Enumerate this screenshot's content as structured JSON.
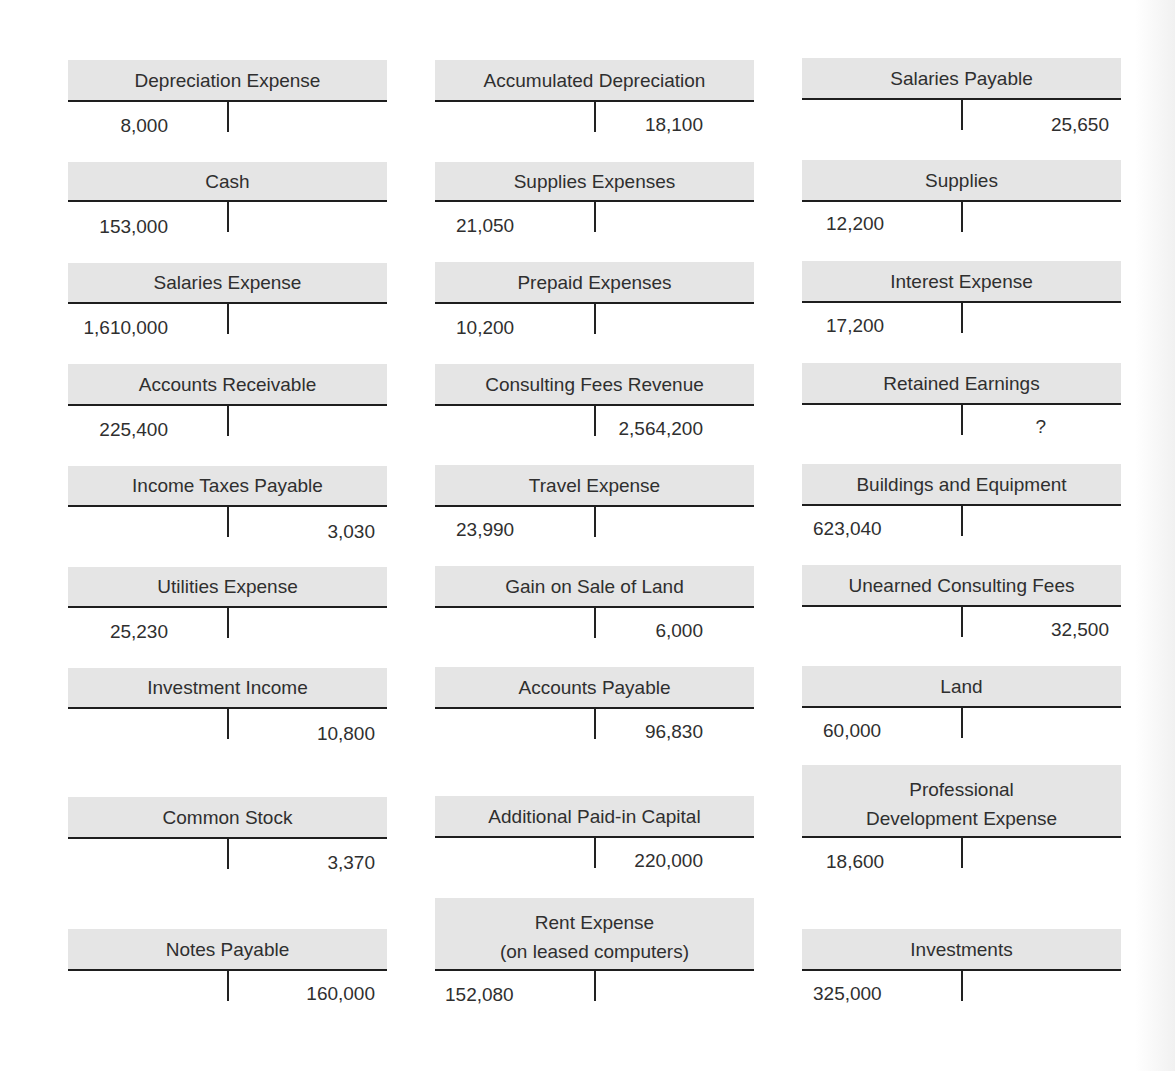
{
  "accounts": [
    {
      "name": "Depreciation Expense",
      "debit": "8,000",
      "credit": ""
    },
    {
      "name": "Accumulated Depreciation",
      "debit": "",
      "credit": "18,100"
    },
    {
      "name": "Salaries Payable",
      "debit": "",
      "credit": "25,650"
    },
    {
      "name": "Cash",
      "debit": "153,000",
      "credit": ""
    },
    {
      "name": "Supplies Expenses",
      "debit": "21,050",
      "credit": ""
    },
    {
      "name": "Supplies",
      "debit": "12,200",
      "credit": ""
    },
    {
      "name": "Salaries Expense",
      "debit": "1,610,000",
      "credit": ""
    },
    {
      "name": "Prepaid Expenses",
      "debit": "10,200",
      "credit": ""
    },
    {
      "name": "Interest Expense",
      "debit": "17,200",
      "credit": ""
    },
    {
      "name": "Accounts Receivable",
      "debit": "225,400",
      "credit": ""
    },
    {
      "name": "Consulting Fees Revenue",
      "debit": "",
      "credit": "2,564,200"
    },
    {
      "name": "Retained Earnings",
      "debit": "",
      "credit": "?"
    },
    {
      "name": "Income Taxes Payable",
      "debit": "",
      "credit": "3,030"
    },
    {
      "name": "Travel Expense",
      "debit": "23,990",
      "credit": ""
    },
    {
      "name": "Buildings and Equipment",
      "debit": "623,040",
      "credit": ""
    },
    {
      "name": "Utilities Expense",
      "debit": "25,230",
      "credit": ""
    },
    {
      "name": "Gain on Sale of Land",
      "debit": "",
      "credit": "6,000"
    },
    {
      "name": "Unearned Consulting Fees",
      "debit": "",
      "credit": "32,500"
    },
    {
      "name": "Investment Income",
      "debit": "",
      "credit": "10,800"
    },
    {
      "name": "Accounts Payable",
      "debit": "",
      "credit": "96,830"
    },
    {
      "name": "Land",
      "debit": "60,000",
      "credit": ""
    },
    {
      "name": "Common Stock",
      "debit": "",
      "credit": "3,370"
    },
    {
      "name": "Additional Paid-in Capital",
      "debit": "",
      "credit": "220,000"
    },
    {
      "name": "Professional\nDevelopment Expense",
      "name_line1": "Professional",
      "name_line2": "Development Expense",
      "debit": "18,600",
      "credit": ""
    },
    {
      "name": "Notes Payable",
      "debit": "",
      "credit": "160,000"
    },
    {
      "name": "Rent Expense\n(on leased computers)",
      "name_line1": "Rent Expense",
      "name_line2": "(on leased computers)",
      "debit": "152,080",
      "credit": ""
    },
    {
      "name": "Investments",
      "debit": "325,000",
      "credit": ""
    }
  ],
  "colors": {
    "header_bg": "#e5e5e5",
    "rule": "#1e1e1e",
    "text": "#2f2f2f"
  }
}
